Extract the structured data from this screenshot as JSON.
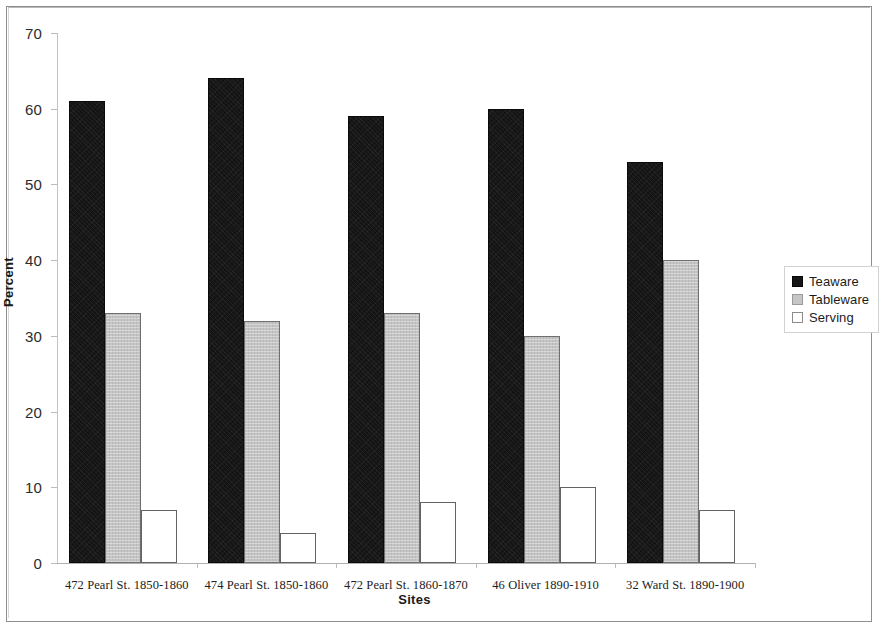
{
  "chart_data": {
    "type": "bar",
    "title": "",
    "xlabel": "Sites",
    "ylabel": "Percent",
    "ylim": [
      0,
      70
    ],
    "yticks": [
      0,
      10,
      20,
      30,
      40,
      50,
      60,
      70
    ],
    "grid": false,
    "legend_position": "right",
    "categories": [
      "472 Pearl St. 1850-1860",
      "474 Pearl St. 1850-1860",
      "472 Pearl St. 1860-1870",
      "46 Oliver 1890-1910",
      "32 Ward St. 1890-1900"
    ],
    "series": [
      {
        "name": "Teaware",
        "color": "#141414",
        "values": [
          61,
          64,
          59,
          60,
          53
        ]
      },
      {
        "name": "Tableware",
        "color": "#c4c4c4",
        "values": [
          33,
          32,
          33,
          30,
          40
        ]
      },
      {
        "name": "Serving",
        "color": "#ffffff",
        "values": [
          7,
          4,
          8,
          10,
          7
        ]
      }
    ]
  },
  "axis": {
    "y_tick_labels": [
      "70",
      "60",
      "50",
      "40",
      "30",
      "20",
      "10",
      "0"
    ],
    "y_title": "Percent",
    "x_title": "Sites"
  },
  "legend": {
    "entries": [
      {
        "label": "Teaware",
        "swatch": "black-square-icon"
      },
      {
        "label": "Tableware",
        "swatch": "gray-square-icon"
      },
      {
        "label": "Serving",
        "swatch": "white-square-icon"
      }
    ]
  }
}
